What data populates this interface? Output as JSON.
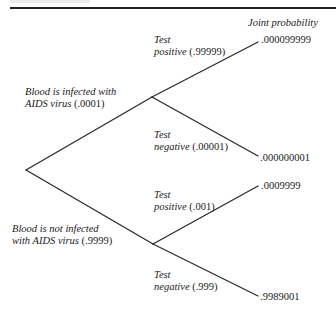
{
  "header": {
    "column_title": "Joint probability"
  },
  "tree": {
    "root": {
      "x": 26,
      "y": 170
    },
    "branches": [
      {
        "id": "infected",
        "line1": "Blood is infected with",
        "line2_prefix": "AIDS virus ",
        "line2_value": "(.0001)",
        "node": {
          "x": 152,
          "y": 97
        },
        "children": [
          {
            "id": "infected-positive",
            "line1": "Test",
            "line2_prefix": "positive ",
            "line2_value": "(.99999)",
            "end": {
              "x": 258,
              "y": 42
            },
            "joint_probability": ".000099999"
          },
          {
            "id": "infected-negative",
            "line1": "Test",
            "line2_prefix": "negative ",
            "line2_value": "(.00001)",
            "end": {
              "x": 258,
              "y": 156
            },
            "joint_probability": ".000000001"
          }
        ]
      },
      {
        "id": "not-infected",
        "line1": "Blood is not infected",
        "line2_prefix": "with AIDS virus ",
        "line2_value": "(.9999)",
        "node": {
          "x": 153,
          "y": 244
        },
        "children": [
          {
            "id": "not-infected-positive",
            "line1": "Test",
            "line2_prefix": "positive ",
            "line2_value": "(.001)",
            "end": {
              "x": 258,
              "y": 186
            },
            "joint_probability": ".0009999"
          },
          {
            "id": "not-infected-negative",
            "line1": "Test",
            "line2_prefix": "negative ",
            "line2_value": "(.999)",
            "end": {
              "x": 258,
              "y": 296
            },
            "joint_probability": ".9989001"
          }
        ]
      }
    ]
  }
}
